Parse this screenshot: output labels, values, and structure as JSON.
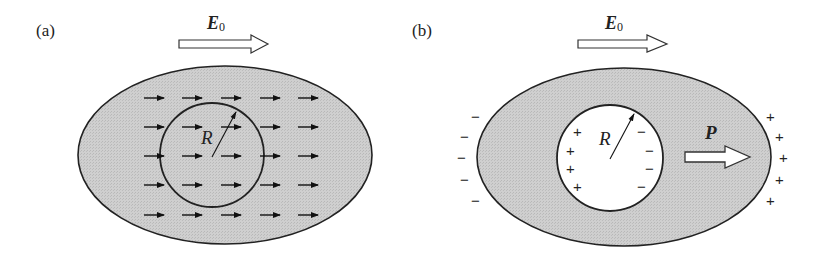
{
  "panels": [
    {
      "id": "a",
      "label": "(a)",
      "field_label": "E",
      "field_subscript": "0",
      "radius_label": "R",
      "description": "Uniform field arrows throughout dielectric ellipsoid with imaginary spherical region of radius R"
    },
    {
      "id": "b",
      "label": "(b)",
      "field_label": "E",
      "field_subscript": "0",
      "radius_label": "R",
      "polarization_label": "P",
      "outer_left_charges": [
        "−",
        "−",
        "−",
        "−",
        "−"
      ],
      "outer_right_charges": [
        "+",
        "+",
        "+",
        "+",
        "+"
      ],
      "cavity_left_charges": [
        "+",
        "+",
        "+",
        "+"
      ],
      "cavity_right_charges": [
        "−",
        "−",
        "−",
        "−"
      ]
    }
  ],
  "colors": {
    "dielectric_fill": "#c8c8c8",
    "stroke": "#222222",
    "cavity_fill": "#ffffff"
  }
}
